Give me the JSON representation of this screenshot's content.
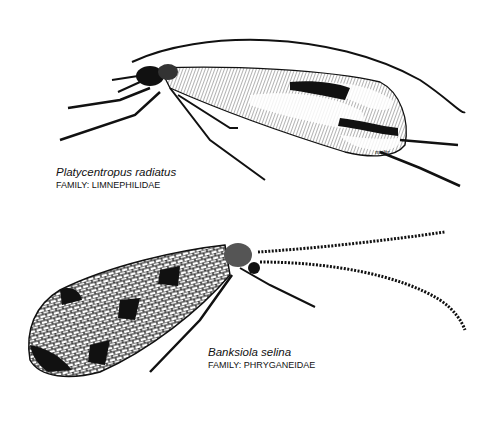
{
  "illustration": {
    "background": "#ffffff",
    "ink": "#111111",
    "specimens": [
      {
        "species": "Platycentropus radiatus",
        "family": "FAMILY: LIMNEPHILIDAE",
        "signature": "mohr"
      },
      {
        "species": "Banksiola selina",
        "family": "FAMILY: PHRYGANEIDAE"
      }
    ]
  }
}
